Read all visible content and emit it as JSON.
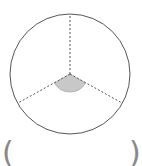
{
  "diagram": {
    "type": "circle-divided-into-three-sectors",
    "circle": {
      "cx": 70,
      "cy": 74,
      "r": 60,
      "stroke": "#555555"
    },
    "radii": [
      {
        "x2": 70,
        "y2": 14
      },
      {
        "x2": 18,
        "y2": 103
      },
      {
        "x2": 122,
        "y2": 103
      }
    ],
    "shaded_sector": {
      "start_deg": 210,
      "end_deg": 330,
      "r": 18,
      "fill": "#c8c8c8",
      "stroke": "#999999"
    },
    "radius_style": {
      "stroke": "#555555",
      "dash": "2,2"
    }
  },
  "answer_blank": {
    "left_paren": "(",
    "right_paren": ")",
    "color": "#888888"
  }
}
